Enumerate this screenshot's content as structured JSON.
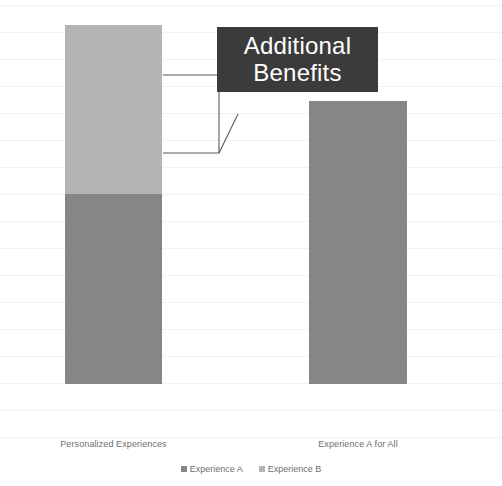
{
  "chart_data": {
    "type": "bar",
    "subtype": "stacked-bar",
    "title": "",
    "xlabel": "",
    "ylabel": "",
    "grid": true,
    "legend_position": "bottom",
    "categories": [
      "Personalized Experiences",
      "Experience A for All"
    ],
    "series": [
      {
        "name": "Experience A",
        "color": "#868686",
        "values": [
          190,
          283
        ]
      },
      {
        "name": "Experience B",
        "color": "#b4b4b4",
        "values": [
          169,
          0
        ]
      }
    ],
    "totals": [
      359,
      283
    ],
    "annotations": [
      {
        "name": "additional-benefits-callout",
        "line1": "Additional",
        "line2": "Benefits",
        "background": "#3b3b3b",
        "text_color": "#ffffff",
        "points_to": "Experience B segment of Personalized Experiences"
      }
    ]
  },
  "legend": {
    "items": [
      {
        "label": "Experience A",
        "color": "#868686"
      },
      {
        "label": "Experience B",
        "color": "#b4b4b4"
      }
    ]
  },
  "axis": {
    "categories": [
      {
        "label": "Personalized Experiences"
      },
      {
        "label": "Experience A for All"
      }
    ]
  },
  "callout": {
    "line1": "Additional",
    "line2": "Benefits"
  },
  "colors": {
    "series_a": "#868686",
    "series_b": "#b4b4b4",
    "callout_bg": "#3b3b3b",
    "callout_fg": "#ffffff",
    "gridline": "#f1f1f1",
    "label_text": "#6e6e6e",
    "background": "#ffffff",
    "bracket_stroke": "#595959"
  }
}
